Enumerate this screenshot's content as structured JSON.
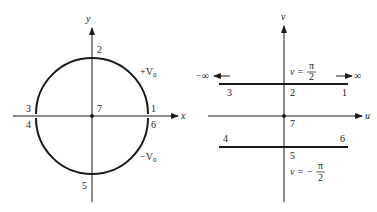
{
  "left_panel": {
    "axes": {
      "x_label": "x",
      "y_label": "y"
    },
    "circle_labels": {
      "upper": "+V",
      "upper_sub": "0",
      "lower": "−V",
      "lower_sub": "0"
    },
    "points": [
      {
        "id": "1",
        "label": "1"
      },
      {
        "id": "2",
        "label": "2"
      },
      {
        "id": "3",
        "label": "3"
      },
      {
        "id": "4",
        "label": "4"
      },
      {
        "id": "5",
        "label": "5"
      },
      {
        "id": "6",
        "label": "6"
      },
      {
        "id": "7",
        "label": "7"
      }
    ]
  },
  "right_panel": {
    "axes": {
      "u_label": "u",
      "v_label": "v"
    },
    "top_line": {
      "eq_lhs": "v =",
      "num": "π",
      "den": "2"
    },
    "bottom_line": {
      "eq_lhs": "v = −",
      "num": "π",
      "den": "2"
    },
    "infinity_left": "−∞",
    "infinity_right": "∞",
    "points": [
      {
        "id": "1",
        "label": "1"
      },
      {
        "id": "2",
        "label": "2"
      },
      {
        "id": "3",
        "label": "3"
      },
      {
        "id": "4",
        "label": "4"
      },
      {
        "id": "5",
        "label": "5"
      },
      {
        "id": "6",
        "label": "6"
      },
      {
        "id": "7",
        "label": "7"
      }
    ]
  }
}
